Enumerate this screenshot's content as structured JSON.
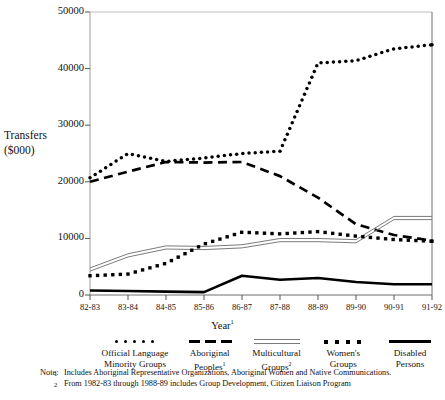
{
  "chart_data": {
    "type": "line",
    "title": "",
    "xlabel": "Year ¹",
    "ylabel": "Transfers ($000)",
    "categories": [
      "82-83",
      "83-84",
      "84-85",
      "85-86",
      "86-87",
      "87-88",
      "88-89",
      "89-90",
      "90-91",
      "91-92"
    ],
    "ylim": [
      0,
      50000
    ],
    "yticks": [
      0,
      10000,
      20000,
      30000,
      40000,
      50000
    ],
    "ytick_labels": [
      "0",
      "10000",
      "20000",
      "30000",
      "40000",
      "50000"
    ],
    "grid": false,
    "legend_position": "below",
    "series": [
      {
        "name": "Official Language Minority Groups",
        "style": "round-dotted",
        "values": [
          20700,
          25000,
          23600,
          24200,
          25000,
          25400,
          41000,
          41400,
          43500,
          44200
        ]
      },
      {
        "name": "Aboriginal Peoples",
        "style": "dashed",
        "values": [
          20000,
          21800,
          23500,
          23400,
          23500,
          21000,
          17200,
          12500,
          10600,
          9600
        ]
      },
      {
        "name": "Multicultural Groups",
        "style": "double-line",
        "values": [
          4500,
          7000,
          8400,
          8300,
          8600,
          9700,
          9700,
          9500,
          13600,
          13600
        ]
      },
      {
        "name": "Women's Groups",
        "style": "square-dotted",
        "values": [
          3400,
          3700,
          5600,
          9000,
          11100,
          10800,
          11200,
          10400,
          9800,
          9500
        ]
      },
      {
        "name": "Disabled Persons",
        "style": "solid-thick",
        "values": [
          800,
          700,
          600,
          500,
          3400,
          2700,
          3000,
          2300,
          1900,
          1900
        ]
      }
    ]
  },
  "axis": {
    "y_label_line1": "Transfers",
    "y_label_line2": "($000)",
    "x_title_text": "Year",
    "x_title_sup": "1"
  },
  "legend": {
    "items": [
      {
        "label_line1": "Official Language",
        "label_line2": "Minority Groups",
        "sup": "",
        "marker": "round-dotted"
      },
      {
        "label_line1": "Aboriginal",
        "label_line2": "Peoples",
        "sup": "1",
        "marker": "dashed"
      },
      {
        "label_line1": "Multicultural",
        "label_line2": "Groups",
        "sup": "2",
        "marker": "double-line"
      },
      {
        "label_line1": "Women's",
        "label_line2": "Groups",
        "sup": "",
        "marker": "square-dotted"
      },
      {
        "label_line1": "Disabled",
        "label_line2": "Persons",
        "sup": "",
        "marker": "solid-thick"
      }
    ]
  },
  "notes": {
    "heading": "Note:",
    "items": [
      {
        "marker": "1",
        "text": "Includes Aboriginal Representative Organizations, Aboriginal Women and Native Communications."
      },
      {
        "marker": "2",
        "text": "From 1982-83 through 1988-89 includes Group Development, Citizen Liaison Program"
      }
    ]
  }
}
